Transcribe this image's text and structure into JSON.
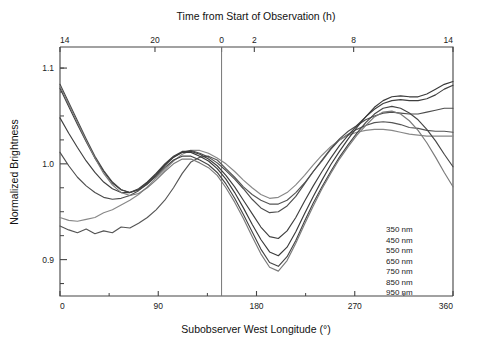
{
  "chart_data": {
    "type": "line",
    "title": "",
    "xlabel": "Subobserver West Longitude (°)",
    "ylabel": "Normalized Brightness",
    "top_xlabel": "Time from Start of Observation (h)",
    "xlim": [
      0,
      360
    ],
    "ylim": [
      0.862,
      1.122
    ],
    "xticks": [
      0,
      90,
      180,
      270,
      360
    ],
    "xticklabels": [
      "0",
      "90",
      "180",
      "270",
      "360"
    ],
    "yticks": [
      0.9,
      1.0,
      1.1
    ],
    "yticklabels": [
      "0.9",
      "1.0",
      "1.1"
    ],
    "y_minor_ticks": [
      0.875,
      0.925,
      0.95,
      0.975,
      1.025,
      1.05,
      1.075,
      1.1
    ],
    "top_axis": {
      "label": "Time from Start of Observation (h)",
      "ticks_x": [
        0,
        87,
        148,
        178,
        269,
        360
      ],
      "ticklabels": [
        "14",
        "20",
        "0",
        "2",
        "8",
        "14"
      ]
    },
    "annotations": [
      {
        "type": "vline",
        "x": 148,
        "label": "start of observation"
      }
    ],
    "grid": false,
    "legend_position": "lower-right",
    "legend_frame": false,
    "series": [
      {
        "name": "350 nm",
        "color": "#555555",
        "x": [
          0,
          8,
          16,
          24,
          32,
          40,
          48,
          56,
          64,
          72,
          80,
          88,
          96,
          104,
          112,
          120,
          128,
          136,
          144,
          152,
          160,
          168,
          176,
          184,
          192,
          200,
          208,
          216,
          224,
          232,
          240,
          248,
          256,
          264,
          272,
          280,
          288,
          296,
          304,
          312,
          320,
          328,
          336,
          344,
          352,
          360
        ],
        "y": [
          0.935,
          0.931,
          0.928,
          0.932,
          0.927,
          0.93,
          0.928,
          0.934,
          0.933,
          0.938,
          0.944,
          0.952,
          0.962,
          0.975,
          0.99,
          1.002,
          1.007,
          1.008,
          1.004,
          0.995,
          0.986,
          0.976,
          0.968,
          0.962,
          0.958,
          0.958,
          0.962,
          0.97,
          0.98,
          0.992,
          1.003,
          1.015,
          1.025,
          1.031,
          1.036,
          1.04,
          1.043,
          1.044,
          1.043,
          1.041,
          1.038,
          1.037,
          1.035,
          1.034,
          1.034,
          1.033
        ]
      },
      {
        "name": "450 nm",
        "color": "#888888",
        "x": [
          0,
          8,
          16,
          24,
          32,
          40,
          48,
          56,
          64,
          72,
          80,
          88,
          96,
          104,
          112,
          120,
          128,
          136,
          144,
          152,
          160,
          168,
          176,
          184,
          192,
          200,
          208,
          216,
          224,
          232,
          240,
          248,
          256,
          264,
          272,
          280,
          288,
          296,
          304,
          312,
          320,
          328,
          336,
          344,
          352,
          360
        ],
        "y": [
          0.944,
          0.941,
          0.94,
          0.942,
          0.944,
          0.949,
          0.952,
          0.957,
          0.962,
          0.968,
          0.976,
          0.985,
          0.994,
          1.003,
          1.01,
          1.014,
          1.014,
          1.011,
          1.006,
          1.0,
          0.992,
          0.983,
          0.975,
          0.968,
          0.964,
          0.965,
          0.97,
          0.978,
          0.988,
          0.999,
          1.009,
          1.018,
          1.025,
          1.03,
          1.033,
          1.035,
          1.036,
          1.036,
          1.035,
          1.033,
          1.031,
          1.03,
          1.029,
          1.029,
          1.029,
          1.029
        ]
      },
      {
        "name": "550 nm",
        "color": "#4d4d4d",
        "x": [
          0,
          8,
          16,
          24,
          32,
          40,
          48,
          56,
          64,
          72,
          80,
          88,
          96,
          104,
          112,
          120,
          128,
          136,
          144,
          152,
          160,
          168,
          176,
          184,
          192,
          200,
          208,
          216,
          224,
          232,
          240,
          248,
          256,
          264,
          272,
          280,
          288,
          296,
          304,
          312,
          320,
          328,
          336,
          344,
          352,
          360
        ],
        "y": [
          1.012,
          0.998,
          0.986,
          0.977,
          0.97,
          0.965,
          0.963,
          0.964,
          0.967,
          0.972,
          0.979,
          0.988,
          0.998,
          1.007,
          1.012,
          1.014,
          1.011,
          1.007,
          1.001,
          0.993,
          0.984,
          0.974,
          0.963,
          0.954,
          0.949,
          0.95,
          0.956,
          0.966,
          0.979,
          0.992,
          1.004,
          1.016,
          1.026,
          1.034,
          1.04,
          1.046,
          1.05,
          1.053,
          1.054,
          1.053,
          1.052,
          1.052,
          1.054,
          1.056,
          1.058,
          1.058
        ]
      },
      {
        "name": "650 nm",
        "color": "#3f3f3f",
        "x": [
          0,
          8,
          16,
          24,
          32,
          40,
          48,
          56,
          64,
          72,
          80,
          88,
          96,
          104,
          112,
          120,
          128,
          136,
          144,
          152,
          160,
          168,
          176,
          184,
          192,
          200,
          208,
          216,
          224,
          232,
          240,
          248,
          256,
          264,
          272,
          280,
          288,
          296,
          304,
          312,
          320,
          328,
          336,
          344,
          352,
          360
        ],
        "y": [
          1.048,
          1.032,
          1.017,
          1.003,
          0.991,
          0.981,
          0.974,
          0.97,
          0.97,
          0.974,
          0.981,
          0.99,
          1.0,
          1.008,
          1.013,
          1.013,
          1.01,
          1.005,
          0.998,
          0.988,
          0.976,
          0.962,
          0.948,
          0.934,
          0.924,
          0.922,
          0.93,
          0.944,
          0.961,
          0.977,
          0.992,
          1.006,
          1.019,
          1.03,
          1.04,
          1.049,
          1.057,
          1.063,
          1.066,
          1.067,
          1.066,
          1.066,
          1.068,
          1.072,
          1.078,
          1.082
        ]
      },
      {
        "name": "750 nm",
        "color": "#3a3a3a",
        "x": [
          0,
          8,
          16,
          24,
          32,
          40,
          48,
          56,
          64,
          72,
          80,
          88,
          96,
          104,
          112,
          120,
          128,
          136,
          144,
          152,
          160,
          168,
          176,
          184,
          192,
          200,
          208,
          216,
          224,
          232,
          240,
          248,
          256,
          264,
          272,
          280,
          288,
          296,
          304,
          312,
          320,
          328,
          336,
          344,
          352,
          360
        ],
        "y": [
          1.079,
          1.06,
          1.041,
          1.023,
          1.006,
          0.992,
          0.98,
          0.973,
          0.97,
          0.973,
          0.98,
          0.989,
          0.999,
          1.007,
          1.012,
          1.012,
          1.008,
          1.003,
          0.995,
          0.984,
          0.97,
          0.954,
          0.937,
          0.921,
          0.908,
          0.904,
          0.913,
          0.929,
          0.948,
          0.966,
          0.983,
          0.999,
          1.013,
          1.026,
          1.038,
          1.049,
          1.059,
          1.066,
          1.07,
          1.071,
          1.07,
          1.07,
          1.073,
          1.078,
          1.083,
          1.086
        ]
      },
      {
        "name": "850 nm",
        "color": "#454545",
        "x": [
          0,
          8,
          16,
          24,
          32,
          40,
          48,
          56,
          64,
          72,
          80,
          88,
          96,
          104,
          112,
          120,
          128,
          136,
          144,
          152,
          160,
          168,
          176,
          184,
          192,
          200,
          208,
          216,
          224,
          232,
          240,
          248,
          256,
          264,
          272,
          280,
          288,
          296,
          304,
          312,
          320,
          328,
          336,
          344,
          352,
          360
        ],
        "y": [
          1.083,
          1.064,
          1.045,
          1.026,
          1.008,
          0.993,
          0.981,
          0.973,
          0.97,
          0.973,
          0.979,
          0.987,
          0.996,
          1.004,
          1.008,
          1.008,
          1.004,
          0.999,
          0.991,
          0.979,
          0.964,
          0.947,
          0.929,
          0.911,
          0.897,
          0.893,
          0.903,
          0.92,
          0.94,
          0.959,
          0.976,
          0.992,
          1.007,
          1.02,
          1.032,
          1.043,
          1.052,
          1.058,
          1.06,
          1.058,
          1.053,
          1.046,
          1.036,
          1.024,
          1.01,
          0.997
        ]
      },
      {
        "name": "950 nm",
        "color": "#7a7a7a",
        "x": [
          0,
          8,
          16,
          24,
          32,
          40,
          48,
          56,
          64,
          72,
          80,
          88,
          96,
          104,
          112,
          120,
          128,
          136,
          144,
          152,
          160,
          168,
          176,
          184,
          192,
          200,
          208,
          216,
          224,
          232,
          240,
          248,
          256,
          264,
          272,
          280,
          288,
          296,
          304,
          312,
          320,
          328,
          336,
          344,
          352,
          360
        ],
        "y": [
          1.081,
          1.062,
          1.043,
          1.024,
          1.006,
          0.99,
          0.978,
          0.97,
          0.967,
          0.969,
          0.975,
          0.983,
          0.992,
          1.0,
          1.005,
          1.005,
          1.001,
          0.996,
          0.988,
          0.975,
          0.96,
          0.943,
          0.924,
          0.906,
          0.892,
          0.888,
          0.899,
          0.917,
          0.937,
          0.956,
          0.974,
          0.99,
          1.005,
          1.018,
          1.03,
          1.04,
          1.049,
          1.054,
          1.055,
          1.052,
          1.045,
          1.035,
          1.022,
          1.007,
          0.991,
          0.976
        ]
      }
    ],
    "legend": [
      {
        "label": "350 nm"
      },
      {
        "label": "450 nm"
      },
      {
        "label": "550 nm"
      },
      {
        "label": "650 nm"
      },
      {
        "label": "750 nm"
      },
      {
        "label": "850 nm"
      },
      {
        "label": "950 nm"
      }
    ]
  }
}
